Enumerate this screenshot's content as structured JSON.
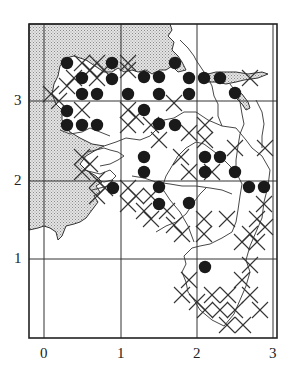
{
  "figure": {
    "type": "distribution-grid-map",
    "colors": {
      "frame": "#222222",
      "grid": "#333333",
      "land_shade": "#c8c8c8",
      "dot": "#1a1a1a",
      "cross": "#333333",
      "background": "#ffffff"
    }
  },
  "axes": {
    "x_ticks": [
      {
        "label": "0",
        "x": 44
      },
      {
        "label": "1",
        "x": 121
      },
      {
        "label": "2",
        "x": 197
      },
      {
        "label": "3",
        "x": 273
      }
    ],
    "y_ticks": [
      {
        "label": "3",
        "y": 101
      },
      {
        "label": "2",
        "y": 181
      },
      {
        "label": "1",
        "y": 259
      }
    ]
  },
  "legend_symbols": {
    "dot": "filled-circle record",
    "cross": "x-mark record"
  },
  "dots": [
    [
      67,
      63
    ],
    [
      112,
      63
    ],
    [
      175,
      63
    ],
    [
      82,
      78
    ],
    [
      112,
      79
    ],
    [
      144,
      77
    ],
    [
      159,
      77
    ],
    [
      189,
      78
    ],
    [
      204,
      78
    ],
    [
      220,
      78
    ],
    [
      82,
      94
    ],
    [
      97,
      94
    ],
    [
      128,
      94
    ],
    [
      159,
      94
    ],
    [
      189,
      94
    ],
    [
      235,
      93
    ],
    [
      67,
      111
    ],
    [
      144,
      110
    ],
    [
      67,
      125
    ],
    [
      82,
      125
    ],
    [
      97,
      125
    ],
    [
      159,
      124
    ],
    [
      175,
      125
    ],
    [
      144,
      157
    ],
    [
      205,
      157
    ],
    [
      220,
      157
    ],
    [
      144,
      172
    ],
    [
      205,
      172
    ],
    [
      235,
      172
    ],
    [
      113,
      188
    ],
    [
      159,
      187
    ],
    [
      249,
      187
    ],
    [
      264,
      187
    ],
    [
      159,
      204
    ],
    [
      189,
      203
    ],
    [
      205,
      267
    ]
  ],
  "crosses": [
    [
      82,
      63
    ],
    [
      97,
      63
    ],
    [
      128,
      63
    ],
    [
      90,
      70
    ],
    [
      104,
      70
    ],
    [
      97,
      78
    ],
    [
      128,
      70
    ],
    [
      74,
      78
    ],
    [
      67,
      86
    ],
    [
      51,
      94
    ],
    [
      59,
      101
    ],
    [
      82,
      110
    ],
    [
      128,
      110
    ],
    [
      128,
      125
    ],
    [
      136,
      117
    ],
    [
      151,
      125
    ],
    [
      159,
      140
    ],
    [
      174,
      103
    ],
    [
      205,
      125
    ],
    [
      205,
      140
    ],
    [
      189,
      133
    ],
    [
      235,
      148
    ],
    [
      265,
      148
    ],
    [
      181,
      157
    ],
    [
      189,
      172
    ],
    [
      212,
      172
    ],
    [
      82,
      157
    ],
    [
      82,
      172
    ],
    [
      90,
      164
    ],
    [
      97,
      180
    ],
    [
      105,
      188
    ],
    [
      97,
      196
    ],
    [
      128,
      188
    ],
    [
      136,
      196
    ],
    [
      128,
      204
    ],
    [
      151,
      196
    ],
    [
      144,
      211
    ],
    [
      151,
      219
    ],
    [
      167,
      211
    ],
    [
      174,
      225
    ],
    [
      182,
      234
    ],
    [
      204,
      219
    ],
    [
      204,
      234
    ],
    [
      227,
      219
    ],
    [
      264,
      204
    ],
    [
      257,
      219
    ],
    [
      250,
      234
    ],
    [
      265,
      227
    ],
    [
      257,
      242
    ],
    [
      242,
      242
    ],
    [
      189,
      280
    ],
    [
      212,
      295
    ],
    [
      220,
      310
    ],
    [
      205,
      310
    ],
    [
      228,
      295
    ],
    [
      242,
      280
    ],
    [
      250,
      295
    ],
    [
      227,
      325
    ],
    [
      243,
      325
    ],
    [
      260,
      310
    ],
    [
      235,
      310
    ],
    [
      197,
      302
    ],
    [
      182,
      295
    ],
    [
      250,
      265
    ],
    [
      250,
      78
    ]
  ]
}
